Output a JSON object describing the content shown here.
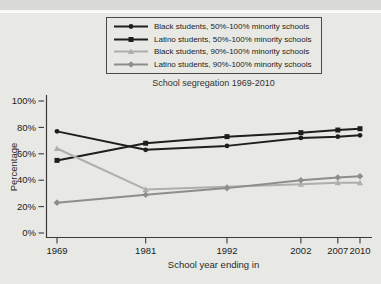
{
  "figure": {
    "background_color": "#e8e9e5",
    "page_edge_strip_color": "#d9dad6",
    "page_edge_line_color": "#fafbf7",
    "legend_border_color": "#4a4a4a",
    "axis_color": "#3a3a3a",
    "tick_text_color": "#222222"
  },
  "chart_data": {
    "type": "line",
    "title": "School segregation 1969-2010",
    "xlabel": "School year ending in",
    "ylabel": "Percentage",
    "x": [
      1969,
      1981,
      1992,
      2002,
      2007,
      2010
    ],
    "x_tick_labels": [
      "1969",
      "1981",
      "1992",
      "2002",
      "2007",
      "2010"
    ],
    "xlim": [
      1969,
      2010
    ],
    "y_ticks": [
      0,
      20,
      40,
      60,
      80,
      100
    ],
    "y_tick_suffix": "%",
    "ylim": [
      0,
      100
    ],
    "grid": false,
    "legend_position": "top-center-boxed",
    "series": [
      {
        "name": "Black students, 50%-100% minority schools",
        "color": "#1e1e1e",
        "marker": "circle",
        "values": [
          77,
          63,
          66,
          72,
          73,
          74
        ]
      },
      {
        "name": "Latino students, 50%-100% minority schools",
        "color": "#1e1e1e",
        "marker": "square",
        "values": [
          55,
          68,
          73,
          76,
          78,
          79
        ]
      },
      {
        "name": "Black students, 90%-100% minority schools",
        "color": "#aeaeab",
        "marker": "triangle",
        "values": [
          64,
          33,
          35,
          37,
          38,
          38
        ]
      },
      {
        "name": "Latino students, 90%-100% minority schools",
        "color": "#8e8d8a",
        "marker": "diamond",
        "values": [
          23,
          29,
          34,
          40,
          42,
          43
        ]
      }
    ]
  }
}
